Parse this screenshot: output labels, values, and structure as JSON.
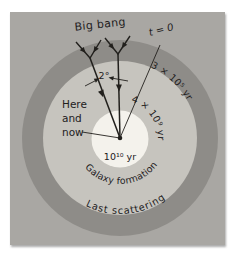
{
  "colors": {
    "page_bg": "#ffffff",
    "panel_bg": "#a9a7a3",
    "last_scattering_ring": "#8e8c88",
    "galaxy_formation_region": "#c6c4be",
    "here_and_now_disc": "#f4f2ec",
    "ink": "#22201d"
  },
  "labels": {
    "big_bang": "Big bang",
    "t_zero": "t = 0",
    "last_scattering_age": "3 × 10⁵ yr",
    "galaxy_formation_age": "4 × 10⁹ yr",
    "universe_age": "10¹⁰ yr",
    "here": "Here",
    "and": "and",
    "now": "now",
    "angle": "2°",
    "galaxy_formation": "Galaxy formation",
    "last_scattering": "Last scattering"
  }
}
